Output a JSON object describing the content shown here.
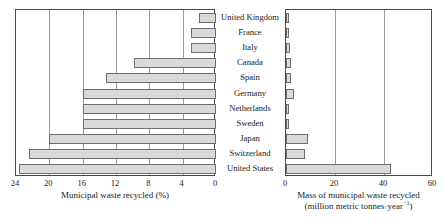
{
  "chart_data": [
    {
      "id": "left",
      "type": "bar",
      "orientation": "horizontal",
      "title": "",
      "xlabel": "Municipal waste recycled (%)",
      "ylabel": "",
      "xlim": [
        24,
        0
      ],
      "reversed_x": true,
      "grid": true,
      "xticks": [
        "24",
        "20",
        "16",
        "12",
        "8",
        "4",
        "0"
      ],
      "xtick_values": [
        24,
        20,
        16,
        12,
        8,
        4,
        0
      ],
      "categories": [
        "United Kingdom",
        "France",
        "Italy",
        "Canada",
        "Spain",
        "Germany",
        "Netherlands",
        "Sweden",
        "Japan",
        "Switzerland",
        "United States"
      ],
      "values": [
        2.0,
        3.0,
        3.0,
        9.8,
        13.2,
        16.0,
        16.0,
        16.0,
        20.0,
        22.5,
        23.6
      ],
      "bar_fill": "#d9d9d9",
      "bar_stroke": "#6e6e6e",
      "legend": ""
    },
    {
      "id": "right",
      "type": "bar",
      "orientation": "horizontal",
      "title": "",
      "xlabel_line1": "Mass of municipal waste recycled",
      "xlabel_line2_pre": "(million metric tonnes",
      "xlabel_line2_mid": "·year",
      "xlabel_line2_sup": "−1",
      "xlabel_line2_post": ")",
      "ylabel": "",
      "xlim": [
        0,
        60
      ],
      "grid": true,
      "xticks": [
        "0",
        "20",
        "40",
        "60"
      ],
      "xtick_values": [
        0,
        20,
        40,
        60
      ],
      "categories": [
        "United Kingdom",
        "France",
        "Italy",
        "Canada",
        "Spain",
        "Germany",
        "Netherlands",
        "Sweden",
        "Japan",
        "Switzerland",
        "United States"
      ],
      "values": [
        1.0,
        1.4,
        1.5,
        2.2,
        2.0,
        3.2,
        1.2,
        1.0,
        9.0,
        7.6,
        43.0
      ],
      "bar_fill": "#d9d9d9",
      "bar_stroke": "#6e6e6e",
      "legend": ""
    }
  ],
  "figure": {
    "background": "#ffffff",
    "axis_color": "#4a4a4a",
    "grid_color": "#9a9a9a"
  }
}
